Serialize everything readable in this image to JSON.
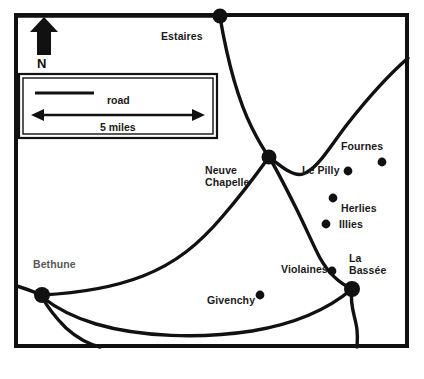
{
  "figure": {
    "type": "map",
    "background_color": "#ffffff",
    "ink_color": "#111111",
    "width": 424,
    "height": 379
  },
  "border": {
    "name": "map-frame",
    "x": 14,
    "y": 13,
    "width": 395,
    "height": 335,
    "stroke_width": 4
  },
  "compass": {
    "arrow_icon": "north-arrow-icon",
    "label": "N"
  },
  "legend": {
    "box": {
      "x": 18,
      "y": 73,
      "width": 200,
      "height": 66
    },
    "entries": [
      {
        "symbol": "line",
        "label": "road"
      },
      {
        "symbol": "double-arrow",
        "label": "5 miles"
      }
    ],
    "road_label": "road",
    "scale_label": "5 miles"
  },
  "places": [
    {
      "name": "Estaires",
      "label": "Estaires",
      "kind": "junction",
      "marker": "large-dot",
      "dot": {
        "x": 220,
        "y": 16
      },
      "label_pos": {
        "x": 161,
        "y": 30
      },
      "label_align": "left",
      "faded": false
    },
    {
      "name": "Neuve Chapelle",
      "label": "Neuve\nChapelle",
      "kind": "junction",
      "marker": "large-dot",
      "dot": {
        "x": 269,
        "y": 157
      },
      "label_pos": {
        "x": 205,
        "y": 164
      },
      "label_align": "left",
      "faded": false
    },
    {
      "name": "Fournes",
      "label": "Fournes",
      "kind": "village",
      "marker": "small-dot",
      "dot": {
        "x": 382,
        "y": 162
      },
      "label_pos": {
        "x": 341,
        "y": 140
      },
      "label_align": "left",
      "faded": false
    },
    {
      "name": "Le Pilly",
      "label": "Le Pilly",
      "kind": "village",
      "marker": "small-dot",
      "dot": {
        "x": 348,
        "y": 171
      },
      "label_pos": {
        "x": 302,
        "y": 164
      },
      "label_align": "left",
      "faded": false
    },
    {
      "name": "Herlies",
      "label": "Herlies",
      "kind": "village",
      "marker": "small-dot",
      "dot": {
        "x": 333,
        "y": 198
      },
      "label_pos": {
        "x": 341,
        "y": 202
      },
      "label_align": "left",
      "faded": false
    },
    {
      "name": "Illies",
      "label": "Illies",
      "kind": "village",
      "marker": "small-dot",
      "dot": {
        "x": 326,
        "y": 224
      },
      "label_pos": {
        "x": 339,
        "y": 222
      },
      "label_align": "left",
      "faded": false
    },
    {
      "name": "Violaines",
      "label": "Violaines",
      "kind": "village",
      "marker": "small-dot",
      "dot": {
        "x": 332,
        "y": 271
      },
      "label_pos": {
        "x": 281,
        "y": 263
      },
      "label_align": "left",
      "faded": false
    },
    {
      "name": "La Bassee",
      "label": "La\nBassée",
      "kind": "junction",
      "marker": "large-dot",
      "dot": {
        "x": 352,
        "y": 289
      },
      "label_pos": {
        "x": 349,
        "y": 252
      },
      "label_align": "left",
      "faded": false
    },
    {
      "name": "Givenchy",
      "label": "Givenchy",
      "kind": "village",
      "marker": "small-dot",
      "dot": {
        "x": 260,
        "y": 295
      },
      "label_pos": {
        "x": 207,
        "y": 294
      },
      "label_align": "left",
      "faded": false
    },
    {
      "name": "Bethune",
      "label": "Bethune",
      "kind": "junction",
      "marker": "large-dot",
      "dot": {
        "x": 42,
        "y": 295
      },
      "label_pos": {
        "x": 33,
        "y": 258
      },
      "label_align": "left",
      "faded": true
    }
  ],
  "roads": [
    {
      "id": "road-top-border-west",
      "desc": "road running along the top of the map west from Estaires"
    },
    {
      "id": "road-estaires-neuve",
      "desc": "Estaires south to Neuve Chapelle junction"
    },
    {
      "id": "road-neuve-labassee",
      "desc": "Neuve Chapelle south-east through Violaines to La Bassée"
    },
    {
      "id": "road-northeast-exit",
      "desc": "road from the crossing north-east off the right edge"
    },
    {
      "id": "road-bethune-neuve",
      "desc": "Bethune east then north-east to Neuve Chapelle crossing"
    },
    {
      "id": "road-bethune-labassee",
      "desc": "Bethune east past Givenchy to La Bassée"
    },
    {
      "id": "road-bethune-west-edge",
      "desc": "short road from Bethune west to the left border"
    },
    {
      "id": "road-bethune-south",
      "desc": "road from Bethune south to the bottom border"
    },
    {
      "id": "road-labassee-south",
      "desc": "road from La Bassée south to the bottom border"
    }
  ]
}
